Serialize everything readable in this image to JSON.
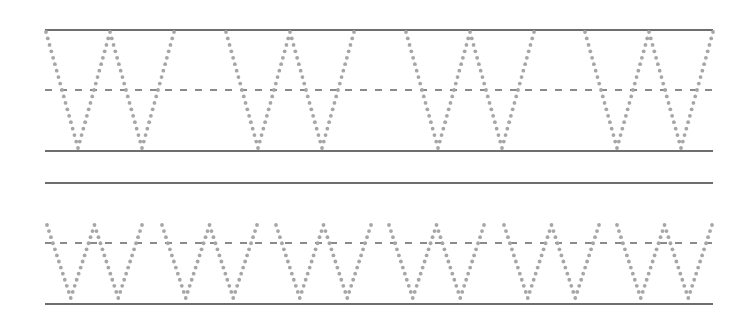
{
  "worksheet": {
    "title": "Letter W tracing practice",
    "letter": "W",
    "colors": {
      "background": "#ffffff",
      "solid_line": "#6e6e6e",
      "dashed_line": "#8a8a8a",
      "dots": "#a6a6a6"
    },
    "line_span": {
      "x_start": 45,
      "x_end": 713
    },
    "rows": [
      {
        "name": "large-w-row",
        "case": "uppercase",
        "top_line_y": 30,
        "mid_dashed_y": 90,
        "base_line_y": 151,
        "letter_top_y": 32,
        "letter_bottom_y": 148,
        "letter_width": 128,
        "letter_x_positions": [
          46,
          226,
          406,
          585
        ],
        "dot_spacing": 6.8
      },
      {
        "name": "small-w-row",
        "case": "lowercase",
        "top_line_y": 183,
        "mid_dashed_y": 243,
        "base_line_y": 304,
        "letter_top_y": 225,
        "letter_bottom_y": 298,
        "letter_width": 95,
        "letter_x_positions": [
          47,
          162,
          276,
          389,
          504,
          617
        ],
        "dot_spacing": 6.2
      }
    ]
  }
}
